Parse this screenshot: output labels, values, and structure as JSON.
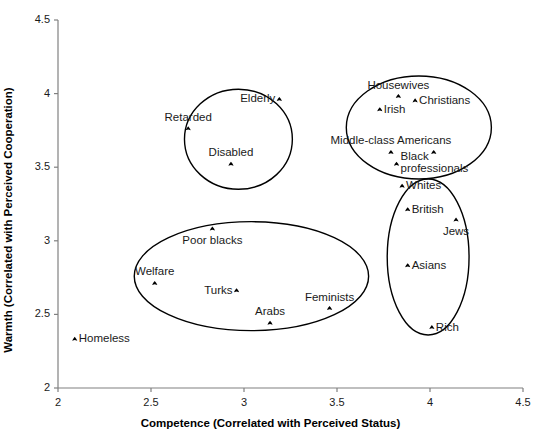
{
  "chart_data": {
    "type": "scatter",
    "title": "",
    "xlabel": "Competence (Correlated with Perceived Status)",
    "ylabel": "Warmth (Correlated with Perceived Cooperation)",
    "xlim": [
      2,
      4.5
    ],
    "ylim": [
      2,
      4.5
    ],
    "xticks": [
      "2",
      "2.5",
      "3",
      "3.5",
      "4",
      "4.5"
    ],
    "yticks": [
      "2",
      "2.5",
      "3",
      "3.5",
      "4",
      "4.5"
    ],
    "xtick_values": [
      2,
      2.5,
      3,
      3.5,
      4,
      4.5
    ],
    "ytick_values": [
      2,
      2.5,
      3,
      3.5,
      4,
      4.5
    ],
    "grid": false,
    "legend": "none",
    "points": [
      {
        "label": "Elderly",
        "x": 3.19,
        "y": 3.96,
        "label_side": "left"
      },
      {
        "label": "Retarded",
        "x": 2.7,
        "y": 3.76,
        "label_side": "above"
      },
      {
        "label": "Disabled",
        "x": 2.93,
        "y": 3.52,
        "label_side": "above"
      },
      {
        "label": "Housewives",
        "x": 3.83,
        "y": 3.98,
        "label_side": "above"
      },
      {
        "label": "Christians",
        "x": 3.92,
        "y": 3.95,
        "label_side": "right"
      },
      {
        "label": "Irish",
        "x": 3.73,
        "y": 3.89,
        "label_side": "right"
      },
      {
        "label": "Middle-class Americans",
        "x": 3.79,
        "y": 3.6,
        "label_side": "above"
      },
      {
        "label": "",
        "x": 4.02,
        "y": 3.6,
        "label_side": "none"
      },
      {
        "label": "Black professionals",
        "x": 3.82,
        "y": 3.52,
        "label_side": "right"
      },
      {
        "label": "Whites",
        "x": 3.85,
        "y": 3.37,
        "label_side": "right"
      },
      {
        "label": "British",
        "x": 3.88,
        "y": 3.21,
        "label_side": "right"
      },
      {
        "label": "Jews",
        "x": 4.14,
        "y": 3.14,
        "label_side": "below"
      },
      {
        "label": "Asians",
        "x": 3.88,
        "y": 2.83,
        "label_side": "right"
      },
      {
        "label": "Rich",
        "x": 4.01,
        "y": 2.41,
        "label_side": "right"
      },
      {
        "label": "Poor blacks",
        "x": 2.83,
        "y": 3.08,
        "label_side": "below"
      },
      {
        "label": "Welfare",
        "x": 2.52,
        "y": 2.71,
        "label_side": "above"
      },
      {
        "label": "Turks",
        "x": 2.96,
        "y": 2.66,
        "label_side": "left"
      },
      {
        "label": "Feminists",
        "x": 3.46,
        "y": 2.54,
        "label_side": "above"
      },
      {
        "label": "Arabs",
        "x": 3.14,
        "y": 2.44,
        "label_side": "above"
      },
      {
        "label": "Homeless",
        "x": 2.09,
        "y": 2.33,
        "label_side": "right"
      }
    ],
    "clusters": [
      {
        "name": "paternalistic-cluster",
        "cx": 2.97,
        "cy": 3.69,
        "rx": 0.29,
        "ry": 0.34
      },
      {
        "name": "admiration-cluster",
        "cx": 3.94,
        "cy": 3.77,
        "rx": 0.39,
        "ry": 0.35
      },
      {
        "name": "envy-cluster",
        "cx": 3.99,
        "cy": 2.89,
        "rx": 0.22,
        "ry": 0.53
      },
      {
        "name": "contemptuous-cluster",
        "cx": 3.04,
        "cy": 2.76,
        "rx": 0.63,
        "ry": 0.37
      }
    ]
  },
  "axes": {
    "x_title": "Competence (Correlated with Perceived Status)",
    "y_title": "Warmth (Correlated with Perceived Cooperation)"
  },
  "colors": {
    "axis": "#808080",
    "text": "#1a1a1a",
    "marker": "#000000",
    "ellipse": "#000000",
    "background": "#ffffff"
  }
}
